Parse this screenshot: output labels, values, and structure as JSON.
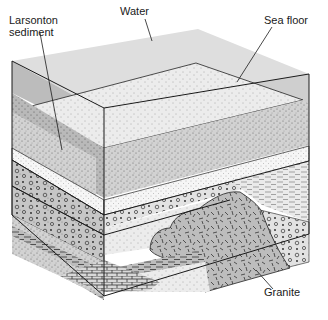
{
  "diagram": {
    "type": "geologic block cross-section",
    "labels": {
      "larsonton_sediment": "Larsonton\nsediment",
      "water": "Water",
      "sea_floor": "Sea floor",
      "granite": "Granite"
    },
    "layers": [
      {
        "name": "Water",
        "pattern": "solid gray"
      },
      {
        "name": "Sea floor sediment",
        "pattern": "fine stipple"
      },
      {
        "name": "Larsonton sediment",
        "pattern": "white stipple band"
      },
      {
        "name": "Conglomerate",
        "pattern": "circles and dots"
      },
      {
        "name": "Sandstone",
        "pattern": "sparse stipple"
      },
      {
        "name": "Shale",
        "pattern": "dashed lines"
      },
      {
        "name": "Limestone",
        "pattern": "brick"
      },
      {
        "name": "Granite",
        "pattern": "random dashes"
      }
    ],
    "colors": {
      "water_top": "#dcdcdc",
      "water_left": "#b8b8b8",
      "water_right": "#c8c8c8",
      "stipple_light": "#e6e6e6",
      "stipple_mid": "#c4c4c4",
      "granite": "#bdbdbd",
      "white_band": "#f4f4f4",
      "outline": "#222222"
    }
  }
}
